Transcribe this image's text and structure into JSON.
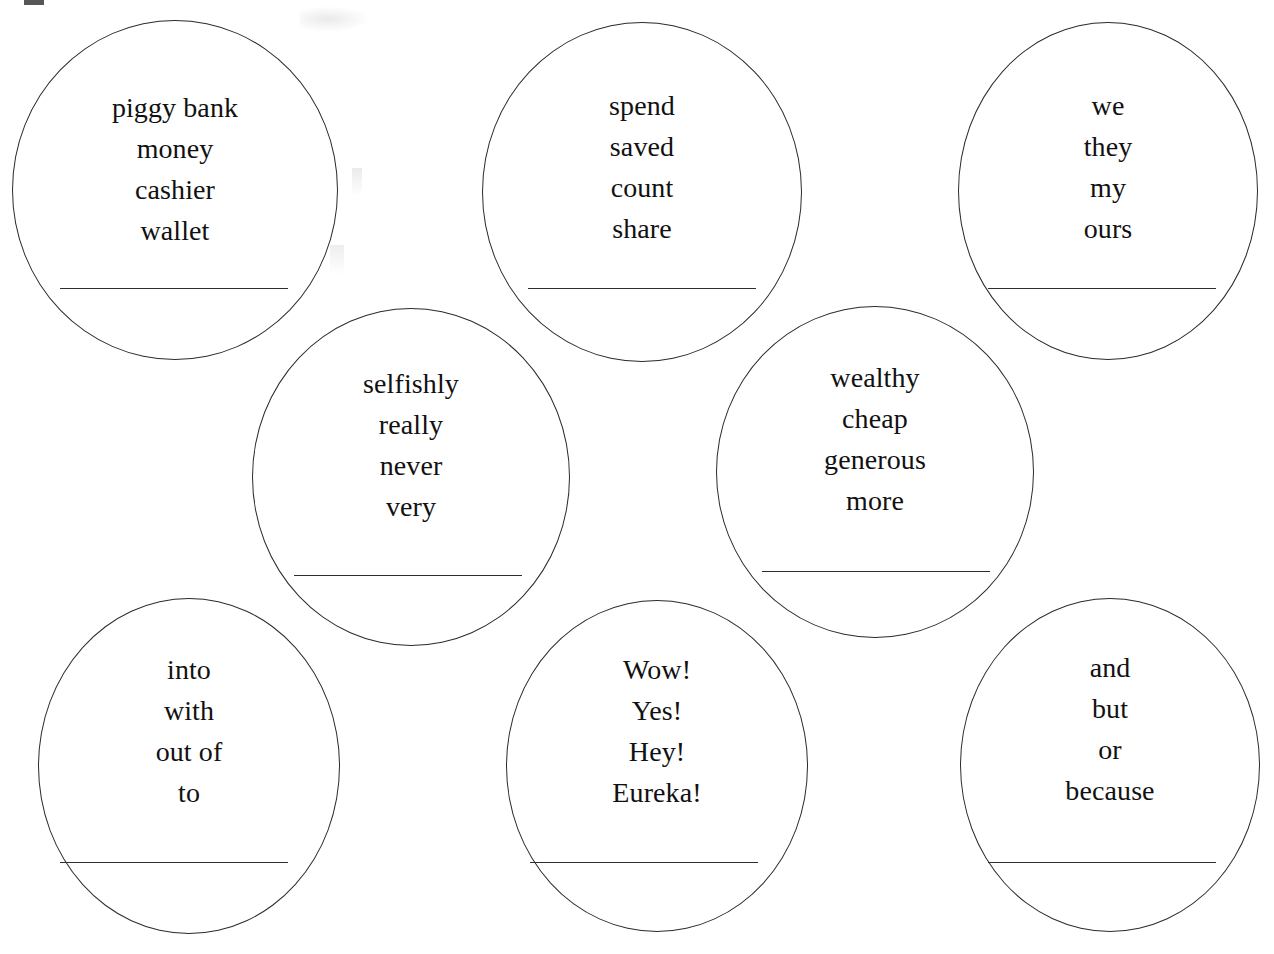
{
  "worksheet": {
    "background_color": "#ffffff",
    "stroke_color": "#2b2b2b",
    "text_color": "#111111",
    "bubbles": [
      {
        "id": "bubble-1",
        "category_hint": "nouns",
        "words": [
          "piggy bank",
          "money",
          "cashier",
          "wallet"
        ],
        "answer_value": ""
      },
      {
        "id": "bubble-2",
        "category_hint": "verbs",
        "words": [
          "spend",
          "saved",
          "count",
          "share"
        ],
        "answer_value": ""
      },
      {
        "id": "bubble-3",
        "category_hint": "pronouns",
        "words": [
          "we",
          "they",
          "my",
          "ours"
        ],
        "answer_value": ""
      },
      {
        "id": "bubble-4",
        "category_hint": "adverbs",
        "words": [
          "selfishly",
          "really",
          "never",
          "very"
        ],
        "answer_value": ""
      },
      {
        "id": "bubble-5",
        "category_hint": "adjectives",
        "words": [
          "wealthy",
          "cheap",
          "generous",
          "more"
        ],
        "answer_value": ""
      },
      {
        "id": "bubble-6",
        "category_hint": "prepositions",
        "words": [
          "into",
          "with",
          "out of",
          "to"
        ],
        "answer_value": ""
      },
      {
        "id": "bubble-7",
        "category_hint": "interjections",
        "words": [
          "Wow!",
          "Yes!",
          "Hey!",
          "Eureka!"
        ],
        "answer_value": ""
      },
      {
        "id": "bubble-8",
        "category_hint": "conjunctions",
        "words": [
          "and",
          "but",
          "or",
          "because"
        ],
        "answer_value": ""
      }
    ]
  }
}
